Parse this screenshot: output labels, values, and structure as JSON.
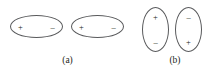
{
  "figure": {
    "background_color": "#ffffff",
    "stroke_color": "#58595b",
    "text_color": "#231f20",
    "panels": [
      {
        "id": "a",
        "caption": "(a)",
        "orientation": "horizontal",
        "dipoles": [
          {
            "id": "a1",
            "orientation": "horizontal",
            "left_sign": "+",
            "right_sign": "–"
          },
          {
            "id": "a2",
            "orientation": "horizontal",
            "left_sign": "+",
            "right_sign": "–"
          }
        ]
      },
      {
        "id": "b",
        "caption": "(b)",
        "orientation": "vertical",
        "dipoles": [
          {
            "id": "b1",
            "orientation": "vertical",
            "top_sign": "+",
            "bottom_sign": "–"
          },
          {
            "id": "b2",
            "orientation": "vertical",
            "top_sign": "–",
            "bottom_sign": "+"
          }
        ]
      }
    ]
  }
}
